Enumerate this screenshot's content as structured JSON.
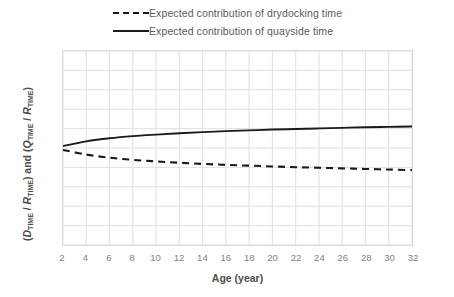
{
  "chart_data": {
    "type": "line",
    "title": "",
    "xlabel": "Age (year)",
    "ylabel": "(DTIME / RTIME) and (QTIME / RTIME)",
    "ylabel_parts": {
      "open1": "(",
      "sym1": "D",
      "sub1": "TIME",
      "slash1": " / ",
      "sym2": "R",
      "sub2": "TIME",
      "close1": ")",
      "conj": " and ",
      "open2": "(",
      "sym3": "Q",
      "sub3": "TIME",
      "slash2": " / ",
      "sym4": "R",
      "sub4": "TIME",
      "close2": ")"
    },
    "xlim": [
      2,
      32
    ],
    "ylim": [
      0.0,
      1.0
    ],
    "grid": true,
    "legend_position": "top",
    "xticks": [
      "2",
      "4",
      "6",
      "8",
      "10",
      "12",
      "14",
      "16",
      "18",
      "20",
      "22",
      "24",
      "26",
      "28",
      "30",
      "32"
    ],
    "yticks": [
      "0.0",
      "0.1",
      "0.2",
      "0.3",
      "0.4",
      "0.5",
      "0.6",
      "0.7",
      "0.8",
      "0.9",
      "1.0"
    ],
    "x": [
      2,
      4,
      6,
      8,
      10,
      12,
      14,
      16,
      18,
      20,
      22,
      24,
      26,
      28,
      30,
      32
    ],
    "series": [
      {
        "name": "Expected contribution of drydocking time",
        "style": "dashed",
        "color": "#1a1a1a",
        "values": [
          0.49,
          0.466,
          0.45,
          0.439,
          0.431,
          0.424,
          0.418,
          0.413,
          0.409,
          0.405,
          0.401,
          0.398,
          0.395,
          0.392,
          0.389,
          0.386
        ]
      },
      {
        "name": "Expected contribution of quayside time",
        "style": "solid",
        "color": "#1a1a1a",
        "values": [
          0.51,
          0.534,
          0.55,
          0.561,
          0.569,
          0.576,
          0.582,
          0.587,
          0.591,
          0.595,
          0.598,
          0.601,
          0.604,
          0.607,
          0.609,
          0.611
        ]
      }
    ]
  },
  "legend": {
    "items": [
      {
        "label": "Expected contribution of drydocking time",
        "style": "dashed"
      },
      {
        "label": "Expected contribution of quayside time",
        "style": "solid"
      }
    ]
  }
}
